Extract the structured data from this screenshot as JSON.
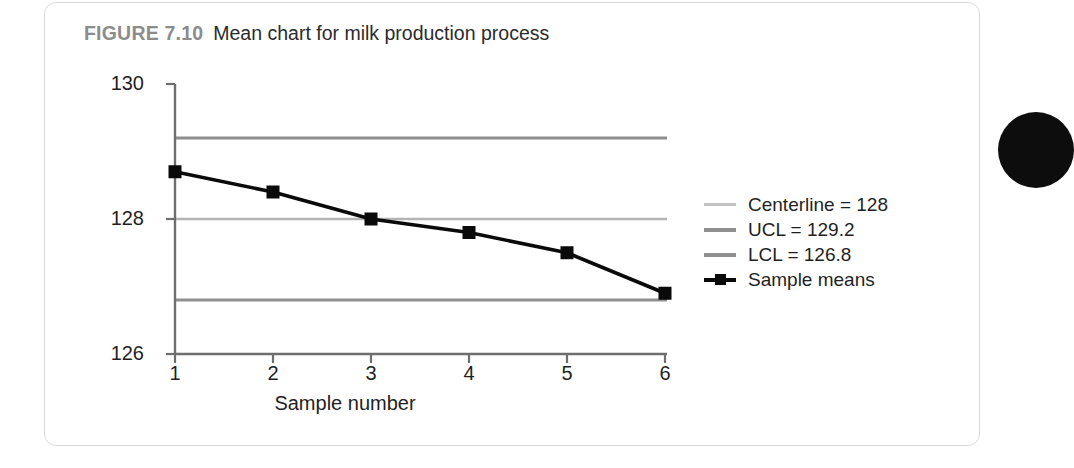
{
  "figure": {
    "label": "FIGURE 7.10",
    "caption": "Mean chart for milk production process"
  },
  "colors": {
    "series_line": "#0a0a0a",
    "centerline": "#b4b4b4",
    "ucl": "#8f8f8f",
    "lcl": "#8f8f8f",
    "axis": "#6e6e6e",
    "text": "#1f1f1f",
    "title_label": "#8c8c8c",
    "card_border": "#d9d9d9",
    "margin_bullet": "#0d0d0d"
  },
  "axes": {
    "y_ticks": [
      "130",
      "128",
      "126"
    ],
    "x_ticks": [
      "1",
      "2",
      "3",
      "4",
      "5",
      "6"
    ],
    "x_title": "Sample number",
    "y_title": ""
  },
  "legend": [
    {
      "label": "Centerline = 128",
      "swatch": "line-light",
      "name": "legend-centerline"
    },
    {
      "label": "UCL = 129.2",
      "swatch": "line-medium",
      "name": "legend-ucl"
    },
    {
      "label": "LCL = 126.8",
      "swatch": "line-medium",
      "name": "legend-lcl"
    },
    {
      "label": "Sample means",
      "swatch": "line-marker",
      "name": "legend-sample-means"
    }
  ],
  "chart_data": {
    "type": "line",
    "title": "Mean chart for milk production process",
    "xlabel": "Sample number",
    "ylabel": "",
    "x": [
      1,
      2,
      3,
      4,
      5,
      6
    ],
    "xlim": [
      1,
      6
    ],
    "ylim": [
      126,
      130
    ],
    "ytick_values": [
      126,
      128,
      130
    ],
    "grid": false,
    "legend_position": "right",
    "series": [
      {
        "name": "Sample means",
        "type": "line",
        "marker": "square",
        "color": "#0a0a0a",
        "values": [
          128.7,
          128.4,
          128.0,
          127.8,
          127.5,
          126.9
        ]
      }
    ],
    "reference_lines": [
      {
        "name": "Centerline",
        "value": 128,
        "label": "Centerline = 128",
        "color": "#b4b4b4"
      },
      {
        "name": "UCL",
        "value": 129.2,
        "label": "UCL = 129.2",
        "color": "#8f8f8f"
      },
      {
        "name": "LCL",
        "value": 126.8,
        "label": "LCL = 126.8",
        "color": "#8f8f8f"
      }
    ]
  }
}
